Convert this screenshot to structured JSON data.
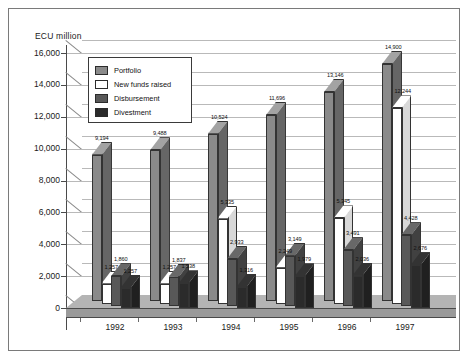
{
  "chart_data": {
    "type": "bar",
    "title": "",
    "subtitle": "",
    "xlabel": "",
    "ylabel": "ECU million",
    "ylim": [
      0,
      16000
    ],
    "ytick_values": [
      0,
      2000,
      4000,
      6000,
      8000,
      10000,
      12000,
      14000,
      16000
    ],
    "ytick_labels": [
      "0",
      "2,000",
      "4,000",
      "6,000",
      "8,000",
      "10,000",
      "12,000",
      "14,000",
      "16,000"
    ],
    "grid": true,
    "legend_position": "upper-left-inside",
    "categories": [
      "1992",
      "1993",
      "1994",
      "1995",
      "1996",
      "1997"
    ],
    "series": [
      {
        "name": "Portfolio",
        "color": "#8a8a8a",
        "values": [
          9194,
          9488,
          10524,
          11696,
          13146,
          14900
        ],
        "labels": [
          "9,194",
          "9,488",
          "10,524",
          "11,696",
          "13,146",
          "14,900"
        ]
      },
      {
        "name": "New funds raised",
        "color": "#ffffff",
        "values": [
          1257,
          1257,
          5335,
          2249,
          5345,
          12244
        ],
        "labels": [
          "1,257",
          "1,257",
          "5,335",
          "2,249",
          "5,345",
          "12,244"
        ]
      },
      {
        "name": "Disbursement",
        "color": "#585858",
        "values": [
          1860,
          1837,
          2933,
          3149,
          3491,
          4428
        ],
        "labels": [
          "1,860",
          "1,837",
          "2,933",
          "3,149",
          "3,491",
          "4,428"
        ]
      },
      {
        "name": "Divestment",
        "color": "#2b2b2b",
        "values": [
          1257,
          1538,
          1316,
          1979,
          2036,
          2676
        ],
        "labels": [
          "1,257",
          "1,538",
          "1,316",
          "1,979",
          "2,036",
          "2,676"
        ]
      }
    ]
  },
  "legend": {
    "items": [
      {
        "label": "Portfolio",
        "swatch": "#8a8a8a"
      },
      {
        "label": "New funds raised",
        "swatch": "#ffffff"
      },
      {
        "label": "Disbursement",
        "swatch": "#585858"
      },
      {
        "label": "Divestment",
        "swatch": "#2b2b2b"
      }
    ]
  },
  "axis": {
    "y_title": "ECU million"
  }
}
